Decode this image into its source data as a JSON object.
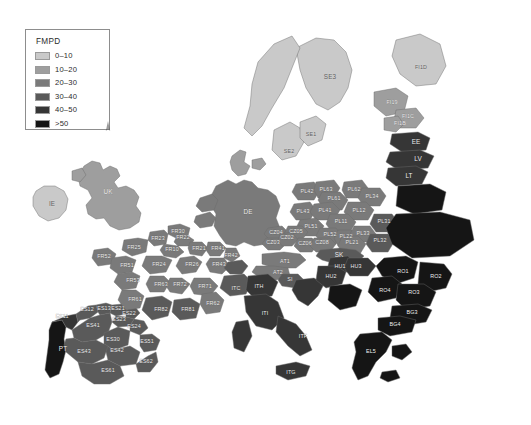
{
  "figure": {
    "kind": "choropleth-map",
    "region": "Europe",
    "variable": "FMPD",
    "background_color": "#ffffff",
    "sea_color": "#ffffff",
    "border_color": "#6b6b6b",
    "label_color": "#f2f2f2"
  },
  "legend": {
    "title": "FMPD",
    "border_color": "#8d8d8d",
    "items": [
      {
        "label": "0–10",
        "color": "#c9c9c9"
      },
      {
        "label": "10–20",
        "color": "#9e9e9e"
      },
      {
        "label": "20–30",
        "color": "#7a7a7a"
      },
      {
        "label": "30–40",
        "color": "#5a5a5a"
      },
      {
        "label": "40–50",
        "color": "#363636"
      },
      {
        "label": ">50",
        "color": "#151515"
      }
    ]
  },
  "caption": {
    "line1": "",
    "line2": "",
    "note": "caption clipped at bottom edge — illegible"
  },
  "chart_data": {
    "type": "map",
    "title": "FMPD",
    "variable": "FMPD",
    "classification": "equal-interval, 6 classes",
    "class_breaks": [
      0,
      10,
      20,
      30,
      40,
      50
    ],
    "class_labels": [
      "0–10",
      "10–20",
      "20–30",
      "30–40",
      "40–50",
      ">50"
    ],
    "class_colors": [
      "#c9c9c9",
      "#9e9e9e",
      "#7a7a7a",
      "#5a5a5a",
      "#363636",
      "#151515"
    ],
    "legend_position": "top-left",
    "regions": [
      {
        "code": "IE",
        "class": 1,
        "x": 52,
        "y": 204
      },
      {
        "code": "UK",
        "class": 2,
        "x": 108,
        "y": 192
      },
      {
        "code": "SE3",
        "class": 1,
        "x": 330,
        "y": 77
      },
      {
        "code": "SE2",
        "class": 1,
        "x": 289,
        "y": 152
      },
      {
        "code": "SE1",
        "class": 1,
        "x": 311,
        "y": 135
      },
      {
        "code": "FI1D",
        "class": 1,
        "x": 421,
        "y": 68
      },
      {
        "code": "FI19",
        "class": 2,
        "x": 392,
        "y": 103
      },
      {
        "code": "FI1C",
        "class": 2,
        "x": 408,
        "y": 117
      },
      {
        "code": "FI1B",
        "class": 2,
        "x": 400,
        "y": 124
      },
      {
        "code": "EE",
        "class": 5,
        "x": 416,
        "y": 142
      },
      {
        "code": "LV",
        "class": 5,
        "x": 418,
        "y": 159
      },
      {
        "code": "LT",
        "class": 5,
        "x": 409,
        "y": 176
      },
      {
        "code": "DE",
        "class": 3,
        "x": 248,
        "y": 212
      },
      {
        "code": "PL42",
        "class": 3,
        "x": 307,
        "y": 192
      },
      {
        "code": "PL63",
        "class": 3,
        "x": 326,
        "y": 190
      },
      {
        "code": "PL62",
        "class": 3,
        "x": 354,
        "y": 190
      },
      {
        "code": "PL61",
        "class": 3,
        "x": 334,
        "y": 199
      },
      {
        "code": "PL34",
        "class": 3,
        "x": 372,
        "y": 197
      },
      {
        "code": "PL43",
        "class": 3,
        "x": 303,
        "y": 212
      },
      {
        "code": "PL41",
        "class": 3,
        "x": 325,
        "y": 211
      },
      {
        "code": "PL12",
        "class": 3,
        "x": 359,
        "y": 211
      },
      {
        "code": "PL11",
        "class": 3,
        "x": 341,
        "y": 222
      },
      {
        "code": "PL31",
        "class": 4,
        "x": 384,
        "y": 222
      },
      {
        "code": "PL51",
        "class": 3,
        "x": 311,
        "y": 227
      },
      {
        "code": "PL52",
        "class": 3,
        "x": 330,
        "y": 235
      },
      {
        "code": "PL22",
        "class": 3,
        "x": 346,
        "y": 237
      },
      {
        "code": "PL33",
        "class": 3,
        "x": 363,
        "y": 234
      },
      {
        "code": "PL21",
        "class": 3,
        "x": 352,
        "y": 243
      },
      {
        "code": "PL32",
        "class": 4,
        "x": 380,
        "y": 241
      },
      {
        "code": "CZ04",
        "class": 3,
        "x": 276,
        "y": 233
      },
      {
        "code": "CZ05",
        "class": 3,
        "x": 296,
        "y": 232
      },
      {
        "code": "CZ03",
        "class": 3,
        "x": 273,
        "y": 243
      },
      {
        "code": "CZ02",
        "class": 3,
        "x": 287,
        "y": 238
      },
      {
        "code": "CZ06",
        "class": 3,
        "x": 305,
        "y": 244
      },
      {
        "code": "CZ08",
        "class": 3,
        "x": 322,
        "y": 243
      },
      {
        "code": "SK",
        "class": 4,
        "x": 339,
        "y": 255
      },
      {
        "code": "AT1",
        "class": 3,
        "x": 285,
        "y": 262
      },
      {
        "code": "AT2",
        "class": 3,
        "x": 278,
        "y": 273
      },
      {
        "code": "SI",
        "class": 4,
        "x": 290,
        "y": 280
      },
      {
        "code": "HU1",
        "class": 5,
        "x": 340,
        "y": 267
      },
      {
        "code": "HU3",
        "class": 5,
        "x": 356,
        "y": 267
      },
      {
        "code": "HU2",
        "class": 5,
        "x": 331,
        "y": 277
      },
      {
        "code": "RO1",
        "class": 6,
        "x": 403,
        "y": 272
      },
      {
        "code": "RO2",
        "class": 6,
        "x": 436,
        "y": 277
      },
      {
        "code": "RO4",
        "class": 6,
        "x": 385,
        "y": 291
      },
      {
        "code": "RO3",
        "class": 6,
        "x": 414,
        "y": 293
      },
      {
        "code": "BG3",
        "class": 6,
        "x": 412,
        "y": 313
      },
      {
        "code": "BG4",
        "class": 6,
        "x": 395,
        "y": 325
      },
      {
        "code": "EL5",
        "class": 6,
        "x": 371,
        "y": 352
      },
      {
        "code": "ITC",
        "class": 4,
        "x": 236,
        "y": 289
      },
      {
        "code": "ITH",
        "class": 5,
        "x": 259,
        "y": 287
      },
      {
        "code": "ITI",
        "class": 5,
        "x": 265,
        "y": 314
      },
      {
        "code": "ITF",
        "class": 5,
        "x": 303,
        "y": 337
      },
      {
        "code": "ITG",
        "class": 5,
        "x": 291,
        "y": 373
      },
      {
        "code": "FR30",
        "class": 3,
        "x": 178,
        "y": 232
      },
      {
        "code": "FR23",
        "class": 3,
        "x": 158,
        "y": 239
      },
      {
        "code": "FR22",
        "class": 3,
        "x": 183,
        "y": 238
      },
      {
        "code": "FR25",
        "class": 3,
        "x": 134,
        "y": 248
      },
      {
        "code": "FR10",
        "class": 3,
        "x": 172,
        "y": 250
      },
      {
        "code": "FR21",
        "class": 3,
        "x": 199,
        "y": 249
      },
      {
        "code": "FR41",
        "class": 3,
        "x": 218,
        "y": 249
      },
      {
        "code": "FR42",
        "class": 3,
        "x": 231,
        "y": 256
      },
      {
        "code": "FR52",
        "class": 3,
        "x": 104,
        "y": 257
      },
      {
        "code": "FR51",
        "class": 3,
        "x": 127,
        "y": 266
      },
      {
        "code": "FR24",
        "class": 3,
        "x": 159,
        "y": 265
      },
      {
        "code": "FR26",
        "class": 3,
        "x": 192,
        "y": 265
      },
      {
        "code": "FR43",
        "class": 3,
        "x": 219,
        "y": 265
      },
      {
        "code": "FR53",
        "class": 3,
        "x": 133,
        "y": 281
      },
      {
        "code": "FR63",
        "class": 3,
        "x": 161,
        "y": 285
      },
      {
        "code": "FR72",
        "class": 3,
        "x": 180,
        "y": 285
      },
      {
        "code": "FR71",
        "class": 3,
        "x": 205,
        "y": 287
      },
      {
        "code": "FR61",
        "class": 3,
        "x": 135,
        "y": 300
      },
      {
        "code": "FR82",
        "class": 4,
        "x": 161,
        "y": 310
      },
      {
        "code": "FR81",
        "class": 4,
        "x": 188,
        "y": 310
      },
      {
        "code": "FR62",
        "class": 3,
        "x": 213,
        "y": 304
      },
      {
        "code": "ES11",
        "class": 5,
        "x": 62,
        "y": 317
      },
      {
        "code": "ES12",
        "class": 4,
        "x": 87,
        "y": 310
      },
      {
        "code": "ES13",
        "class": 4,
        "x": 104,
        "y": 309
      },
      {
        "code": "ES21",
        "class": 4,
        "x": 118,
        "y": 309
      },
      {
        "code": "ES22",
        "class": 4,
        "x": 129,
        "y": 314
      },
      {
        "code": "ES23",
        "class": 4,
        "x": 119,
        "y": 320
      },
      {
        "code": "ES24",
        "class": 4,
        "x": 134,
        "y": 327
      },
      {
        "code": "ES41",
        "class": 4,
        "x": 93,
        "y": 326
      },
      {
        "code": "ES30",
        "class": 4,
        "x": 113,
        "y": 340
      },
      {
        "code": "ES42",
        "class": 4,
        "x": 117,
        "y": 351
      },
      {
        "code": "ES43",
        "class": 4,
        "x": 84,
        "y": 352
      },
      {
        "code": "ES51",
        "class": 4,
        "x": 147,
        "y": 342
      },
      {
        "code": "ES61",
        "class": 4,
        "x": 108,
        "y": 371
      },
      {
        "code": "ES62",
        "class": 4,
        "x": 146,
        "y": 362
      },
      {
        "code": "PT",
        "class": 6,
        "x": 63,
        "y": 349
      }
    ]
  }
}
